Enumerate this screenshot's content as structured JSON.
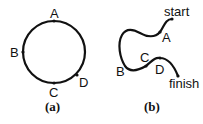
{
  "panels": [
    {
      "id": "a",
      "caption": "(a)",
      "shape": "circle",
      "points": [
        {
          "label": "A",
          "position": "top"
        },
        {
          "label": "B",
          "position": "left"
        },
        {
          "label": "C",
          "position": "bottom"
        },
        {
          "label": "D",
          "position": "lower-right"
        }
      ]
    },
    {
      "id": "b",
      "caption": "(b)",
      "shape": "open-curve",
      "endpoints": {
        "start": "start",
        "finish": "finish"
      },
      "points": [
        {
          "label": "A"
        },
        {
          "label": "B"
        },
        {
          "label": "C"
        },
        {
          "label": "D"
        }
      ]
    }
  ],
  "colors": {
    "stroke": "#111111",
    "background": "#ffffff"
  }
}
